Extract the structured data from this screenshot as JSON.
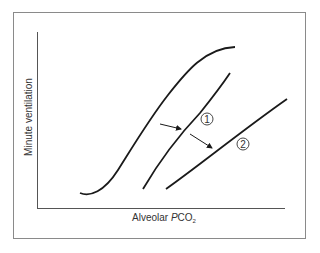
{
  "diagram": {
    "x_axis_label_prefix": "Alveolar ",
    "x_axis_label_var": "P",
    "x_axis_label_chem": "CO",
    "x_axis_label_sub": "2",
    "y_axis_label": "Minute ventilation",
    "curves": [
      {
        "id": "control",
        "label": "",
        "description": "Normal CO2 response curve (sigmoid)"
      },
      {
        "id": "curve-1",
        "label": "1",
        "description": "Response curve shifted right"
      },
      {
        "id": "curve-2",
        "label": "2",
        "description": "Response curve shifted right with reduced slope"
      }
    ],
    "arrows": [
      {
        "from": "control",
        "to": "curve-1"
      },
      {
        "from": "curve-1",
        "to": "curve-2"
      }
    ],
    "colors": {
      "line": "#1a1a1a",
      "axis": "#555555",
      "frame": "#8a8a8a",
      "text": "#333333"
    }
  }
}
